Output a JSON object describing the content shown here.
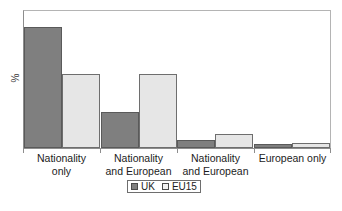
{
  "chart_data": {
    "type": "bar",
    "title": "",
    "subtitle": "",
    "xlabel": "",
    "ylabel": "%",
    "ylim": [
      0,
      50
    ],
    "grid": false,
    "legend_position": "bottom",
    "categories": [
      "Nationality\nonly",
      "Nationality\nand European",
      "Nationality\nand European",
      "European only"
    ],
    "series": [
      {
        "name": "UK",
        "color": "#7f7f7f",
        "values": [
          44,
          13,
          3,
          1.5
        ]
      },
      {
        "name": "EU15",
        "color": "#e6e6e6",
        "values": [
          27,
          27,
          5,
          2
        ]
      }
    ]
  },
  "axis": {
    "y_label": "%"
  },
  "legend": {
    "items": [
      {
        "label": "UK"
      },
      {
        "label": "EU15"
      }
    ]
  },
  "categories": {
    "c0": "Nationality\nonly",
    "c1": "Nationality\nand European",
    "c2": "Nationality\nand European",
    "c3": "European only"
  },
  "colors": {
    "uk": "#7f7f7f",
    "eu15": "#e6e6e6",
    "frame": "#8d8d8d",
    "text": "#1c1c1c",
    "background": "#ffffff"
  }
}
